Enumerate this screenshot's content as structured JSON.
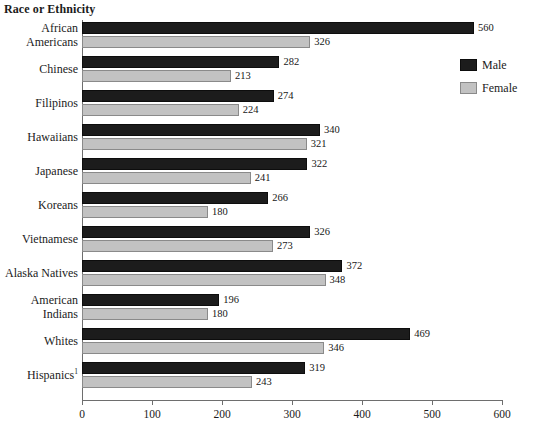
{
  "chart_data": {
    "type": "bar",
    "orientation": "horizontal",
    "title": "Race or Ethnicity",
    "xlabel": "",
    "ylabel": "Race or Ethnicity",
    "xlim": [
      0,
      600
    ],
    "xticks": [
      0,
      100,
      200,
      300,
      400,
      500,
      600
    ],
    "xtick_labels": [
      "0",
      "100",
      "200",
      "300",
      "400",
      "500",
      "600"
    ],
    "grid": false,
    "legend_position": "top-right",
    "categories": [
      "African Americans",
      "Chinese",
      "Filipinos",
      "Hawaiians",
      "Japanese",
      "Koreans",
      "Vietnamese",
      "Alaska Natives",
      "American Indians",
      "Whites",
      "Hispanics"
    ],
    "category_lines": [
      [
        "African",
        "Americans"
      ],
      [
        "Chinese"
      ],
      [
        "Filipinos"
      ],
      [
        "Hawaiians"
      ],
      [
        "Japanese"
      ],
      [
        "Koreans"
      ],
      [
        "Vietnamese"
      ],
      [
        "Alaska Natives"
      ],
      [
        "American",
        "Indians"
      ],
      [
        "Whites"
      ],
      [
        "Hispanics"
      ]
    ],
    "category_footnote_markers": [
      "",
      "",
      "",
      "",
      "",
      "",
      "",
      "",
      "",
      "",
      "1"
    ],
    "series": [
      {
        "name": "Male",
        "color": "#1c1c1c",
        "values": [
          560,
          282,
          274,
          340,
          322,
          266,
          326,
          372,
          196,
          469,
          319
        ]
      },
      {
        "name": "Female",
        "color": "#c2c2c2",
        "values": [
          326,
          213,
          224,
          321,
          241,
          180,
          273,
          348,
          180,
          346,
          243
        ]
      }
    ]
  },
  "legend": {
    "items": [
      {
        "label": "Male"
      },
      {
        "label": "Female"
      }
    ]
  }
}
